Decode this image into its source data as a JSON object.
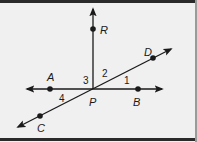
{
  "diagram": {
    "type": "geometry-lines-and-angles",
    "colors": {
      "background": "#f0f0f0",
      "ink": "#1a1a1a",
      "border": "#2a2a2a"
    },
    "points": {
      "P": {
        "label": "P",
        "x": 93,
        "y": 89
      },
      "R": {
        "label": "R",
        "x": 93,
        "y": 29
      },
      "A": {
        "label": "A",
        "x": 50,
        "y": 89
      },
      "B": {
        "label": "B",
        "x": 138,
        "y": 89
      },
      "C": {
        "label": "C",
        "x": 40,
        "y": 116
      },
      "D": {
        "label": "D",
        "x": 153,
        "y": 58
      }
    },
    "lines": [
      {
        "name": "ray-PR",
        "description": "ray from P through R, arrow upward"
      },
      {
        "name": "line-AB",
        "description": "horizontal line through A, P, B, arrows both ends"
      },
      {
        "name": "line-CD",
        "description": "diagonal line through C, P, D, arrows both ends"
      }
    ],
    "angles": [
      {
        "label": "1",
        "between": "PB and PD"
      },
      {
        "label": "2",
        "between": "PD and PR"
      },
      {
        "label": "3",
        "between": "PR and PA"
      },
      {
        "label": "4",
        "between": "PA and PC"
      }
    ]
  }
}
